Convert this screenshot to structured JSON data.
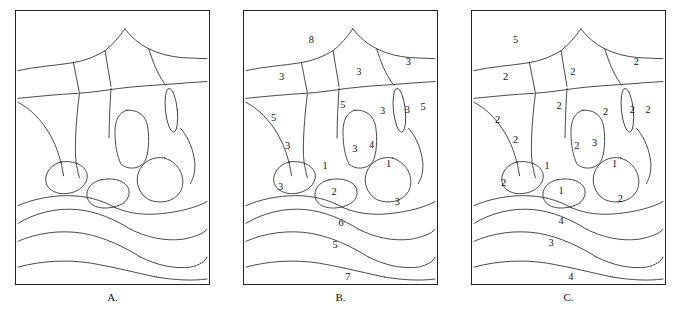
{
  "figure": {
    "panels": [
      {
        "id": "A",
        "caption": "A.",
        "labels": []
      },
      {
        "id": "B",
        "caption": "B.",
        "labels": [
          {
            "text": "8",
            "x": 68,
            "y": 30
          },
          {
            "text": "3",
            "x": 116,
            "y": 62
          },
          {
            "text": "3",
            "x": 166,
            "y": 52
          },
          {
            "text": "3",
            "x": 38,
            "y": 67
          },
          {
            "text": "5",
            "x": 100,
            "y": 95
          },
          {
            "text": "3",
            "x": 140,
            "y": 101
          },
          {
            "text": "3",
            "x": 165,
            "y": 100
          },
          {
            "text": "5",
            "x": 181,
            "y": 97
          },
          {
            "text": "5",
            "x": 30,
            "y": 108
          },
          {
            "text": "3",
            "x": 44,
            "y": 137
          },
          {
            "text": "3",
            "x": 112,
            "y": 140
          },
          {
            "text": "4",
            "x": 129,
            "y": 136
          },
          {
            "text": "1",
            "x": 82,
            "y": 157
          },
          {
            "text": "1",
            "x": 146,
            "y": 155
          },
          {
            "text": "3",
            "x": 37,
            "y": 178
          },
          {
            "text": "2",
            "x": 91,
            "y": 183
          },
          {
            "text": "3",
            "x": 155,
            "y": 193
          },
          {
            "text": "6",
            "x": 98,
            "y": 214
          },
          {
            "text": "5",
            "x": 92,
            "y": 236
          },
          {
            "text": "7",
            "x": 105,
            "y": 269
          }
        ]
      },
      {
        "id": "C",
        "caption": "C.",
        "labels": [
          {
            "text": "5",
            "x": 44,
            "y": 30
          },
          {
            "text": "2",
            "x": 102,
            "y": 62
          },
          {
            "text": "2",
            "x": 166,
            "y": 52
          },
          {
            "text": "2",
            "x": 34,
            "y": 67
          },
          {
            "text": "2",
            "x": 88,
            "y": 96
          },
          {
            "text": "2",
            "x": 135,
            "y": 102
          },
          {
            "text": "2",
            "x": 162,
            "y": 100
          },
          {
            "text": "2",
            "x": 178,
            "y": 100
          },
          {
            "text": "2",
            "x": 26,
            "y": 110
          },
          {
            "text": "2",
            "x": 44,
            "y": 131
          },
          {
            "text": "2",
            "x": 106,
            "y": 137
          },
          {
            "text": "3",
            "x": 124,
            "y": 134
          },
          {
            "text": "1",
            "x": 76,
            "y": 157
          },
          {
            "text": "1",
            "x": 144,
            "y": 155
          },
          {
            "text": "2",
            "x": 32,
            "y": 174
          },
          {
            "text": "1",
            "x": 90,
            "y": 182
          },
          {
            "text": "2",
            "x": 150,
            "y": 190
          },
          {
            "text": "4",
            "x": 90,
            "y": 212
          },
          {
            "text": "3",
            "x": 80,
            "y": 234
          },
          {
            "text": "4",
            "x": 100,
            "y": 269
          }
        ]
      }
    ],
    "colors": {
      "stroke": "#1a1a1a",
      "background": "#ffffff",
      "text": "#111111"
    }
  }
}
